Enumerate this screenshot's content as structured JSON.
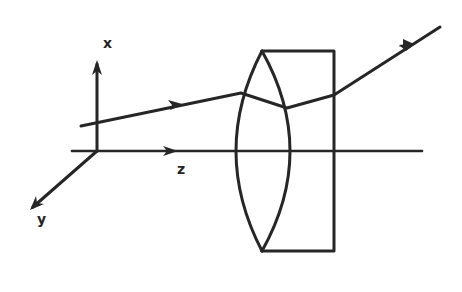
{
  "diagram": {
    "type": "optics-ray-diagram",
    "axes": {
      "x_label": "x",
      "y_label": "y",
      "z_label": "z"
    },
    "elements": [
      {
        "name": "biconvex-lens",
        "kind": "lens"
      },
      {
        "name": "plano-block",
        "kind": "rectangular element"
      },
      {
        "name": "incident-ray",
        "kind": "ray"
      },
      {
        "name": "optical-axis",
        "kind": "axis"
      }
    ],
    "colors": {
      "line": "#262626",
      "background": "#ffffff"
    }
  }
}
